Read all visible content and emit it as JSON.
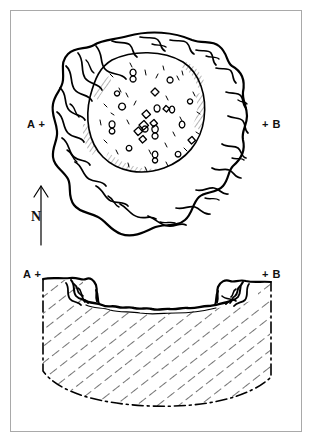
{
  "figure": {
    "type": "archaeological-site-drawing",
    "background_color": "#ffffff",
    "ink_color": "#000000",
    "frame_color": "#a9a9a9"
  },
  "plan": {
    "label_a": "A +",
    "label_b": "+ B",
    "feature": "circular stone bank with pebbled interior hollow"
  },
  "section": {
    "label_a": "A +",
    "label_b": "+ B",
    "feature": "trough-shaped cut profile with hatched fill and dash-dot boundary"
  },
  "north_arrow": {
    "letter": "N",
    "direction": "up"
  }
}
